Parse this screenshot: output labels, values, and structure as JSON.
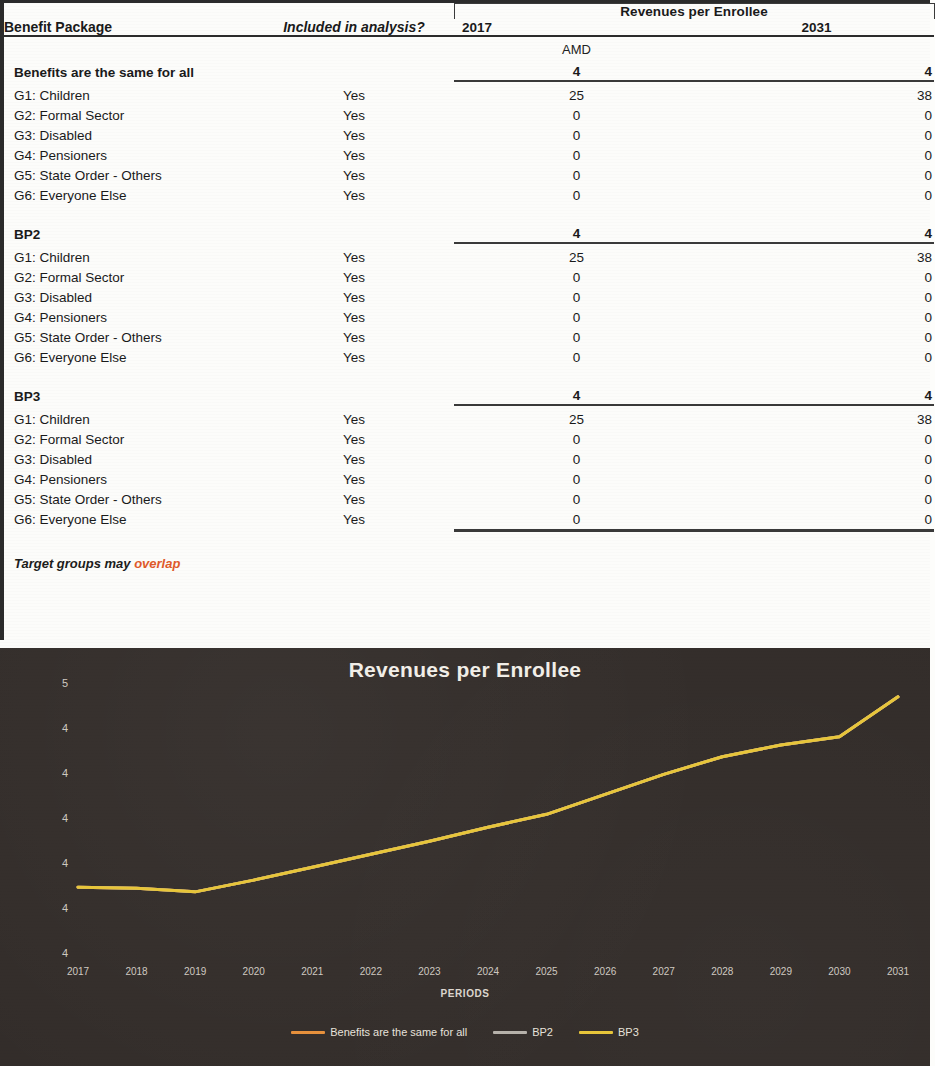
{
  "table": {
    "column_headers": {
      "benefit_package": "Benefit Package",
      "included": "Included in analysis?",
      "group_header": "Revenues per Enrollee",
      "year_2017": "2017",
      "year_2031": "2031"
    },
    "unit_row": "AMD",
    "sections": [
      {
        "name": "Benefits are the same for all",
        "total_2017": "4",
        "total_2031": "4",
        "rows": [
          {
            "group": "G1: Children",
            "included": "Yes",
            "v2017": "25",
            "v2031": "38"
          },
          {
            "group": "G2: Formal Sector",
            "included": "Yes",
            "v2017": "0",
            "v2031": "0"
          },
          {
            "group": "G3: Disabled",
            "included": "Yes",
            "v2017": "0",
            "v2031": "0"
          },
          {
            "group": "G4: Pensioners",
            "included": "Yes",
            "v2017": "0",
            "v2031": "0"
          },
          {
            "group": "G5: State Order - Others",
            "included": "Yes",
            "v2017": "0",
            "v2031": "0"
          },
          {
            "group": "G6: Everyone Else",
            "included": "Yes",
            "v2017": "0",
            "v2031": "0"
          }
        ]
      },
      {
        "name": "BP2",
        "total_2017": "4",
        "total_2031": "4",
        "rows": [
          {
            "group": "G1: Children",
            "included": "Yes",
            "v2017": "25",
            "v2031": "38"
          },
          {
            "group": "G2: Formal Sector",
            "included": "Yes",
            "v2017": "0",
            "v2031": "0"
          },
          {
            "group": "G3: Disabled",
            "included": "Yes",
            "v2017": "0",
            "v2031": "0"
          },
          {
            "group": "G4: Pensioners",
            "included": "Yes",
            "v2017": "0",
            "v2031": "0"
          },
          {
            "group": "G5: State Order - Others",
            "included": "Yes",
            "v2017": "0",
            "v2031": "0"
          },
          {
            "group": "G6: Everyone Else",
            "included": "Yes",
            "v2017": "0",
            "v2031": "0"
          }
        ]
      },
      {
        "name": "BP3",
        "total_2017": "4",
        "total_2031": "4",
        "rows": [
          {
            "group": "G1: Children",
            "included": "Yes",
            "v2017": "25",
            "v2031": "38"
          },
          {
            "group": "G2: Formal Sector",
            "included": "Yes",
            "v2017": "0",
            "v2031": "0"
          },
          {
            "group": "G3: Disabled",
            "included": "Yes",
            "v2017": "0",
            "v2031": "0"
          },
          {
            "group": "G4: Pensioners",
            "included": "Yes",
            "v2017": "0",
            "v2031": "0"
          },
          {
            "group": "G5: State Order - Others",
            "included": "Yes",
            "v2017": "0",
            "v2031": "0"
          },
          {
            "group": "G6: Everyone Else",
            "included": "Yes",
            "v2017": "0",
            "v2031": "0"
          }
        ]
      }
    ],
    "footnote": {
      "text": "Target groups may ",
      "highlight": "overlap",
      "highlight_color": "#e05a2b"
    }
  },
  "chart_data": {
    "type": "line",
    "title": "Revenues per Enrollee",
    "xlabel": "PERIODS",
    "ylabel": "AMD",
    "background": "#332d2a",
    "grid": false,
    "legend_position": "bottom",
    "x": [
      "2017",
      "2018",
      "2019",
      "2020",
      "2021",
      "2022",
      "2023",
      "2024",
      "2025",
      "2026",
      "2027",
      "2028",
      "2029",
      "2030",
      "2031"
    ],
    "ytick_labels": [
      "5",
      "4",
      "4",
      "4",
      "4",
      "4",
      "4"
    ],
    "ylim": [
      40000,
      52000
    ],
    "series": [
      {
        "name": "Benefits are the same for all",
        "color": "#e8913c",
        "values": [
          43100,
          43050,
          42900,
          43400,
          43950,
          44500,
          45050,
          45650,
          46200,
          47050,
          47900,
          48650,
          49150,
          49500,
          51200
        ]
      },
      {
        "name": "BP2",
        "color": "#b7b2ab",
        "values": [
          43100,
          43050,
          42900,
          43400,
          43950,
          44500,
          45050,
          45650,
          46200,
          47050,
          47900,
          48650,
          49150,
          49500,
          51200
        ]
      },
      {
        "name": "BP3",
        "color": "#e8c63a",
        "values": [
          43100,
          43050,
          42900,
          43400,
          43950,
          44500,
          45050,
          45650,
          46200,
          47050,
          47900,
          48650,
          49150,
          49500,
          51200
        ]
      }
    ]
  }
}
